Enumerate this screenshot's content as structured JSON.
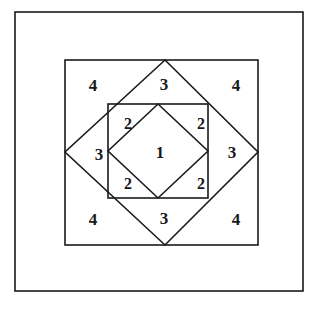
{
  "figure": {
    "background_color": "#ffffff",
    "stroke_color": "#1a1a1a",
    "label_color": "#18181a",
    "canvas": {
      "width": 316,
      "height": 309
    },
    "shapes": {
      "outer_frame": {
        "name": "outer-border-rectangle",
        "x1": 15,
        "y1": 12,
        "x2": 303,
        "y2": 291
      },
      "middle_square": {
        "name": "middle-square",
        "x1": 65,
        "y1": 60,
        "x2": 258,
        "y2": 245
      },
      "large_diamond": {
        "name": "large-rotated-square",
        "points": "165,60 258,152 165,245 65,152"
      },
      "inner_square": {
        "name": "inner-square",
        "x1": 108,
        "y1": 104,
        "x2": 208,
        "y2": 198
      },
      "inner_diamond": {
        "name": "inner-rotated-square",
        "points": "158,104 208,151 158,198 108,151"
      }
    },
    "labels": [
      {
        "id": "region-1-center",
        "text": "1",
        "x": 160,
        "y": 152,
        "region": "inner-rotated-square"
      },
      {
        "id": "region-2-top-left",
        "text": "2",
        "x": 128,
        "y": 124,
        "region": "inner-square-corner"
      },
      {
        "id": "region-2-top-right",
        "text": "2",
        "x": 201,
        "y": 124,
        "region": "inner-square-corner"
      },
      {
        "id": "region-2-bottom-left",
        "text": "2",
        "x": 128,
        "y": 184,
        "region": "inner-square-corner"
      },
      {
        "id": "region-2-bottom-right",
        "text": "2",
        "x": 201,
        "y": 184,
        "region": "inner-square-corner"
      },
      {
        "id": "region-3-top",
        "text": "3",
        "x": 164,
        "y": 84,
        "region": "diamond-segment"
      },
      {
        "id": "region-3-right",
        "text": "3",
        "x": 232,
        "y": 152,
        "region": "diamond-segment"
      },
      {
        "id": "region-3-bottom",
        "text": "3",
        "x": 164,
        "y": 218,
        "region": "diamond-segment"
      },
      {
        "id": "region-3-left",
        "text": "3",
        "x": 99,
        "y": 154,
        "region": "diamond-segment"
      },
      {
        "id": "region-4-top-left",
        "text": "4",
        "x": 93,
        "y": 85,
        "region": "middle-square-corner"
      },
      {
        "id": "region-4-top-right",
        "text": "4",
        "x": 236,
        "y": 85,
        "region": "middle-square-corner"
      },
      {
        "id": "region-4-bottom-left",
        "text": "4",
        "x": 93,
        "y": 219,
        "region": "middle-square-corner"
      },
      {
        "id": "region-4-bottom-right",
        "text": "4",
        "x": 236,
        "y": 219,
        "region": "middle-square-corner"
      }
    ]
  }
}
